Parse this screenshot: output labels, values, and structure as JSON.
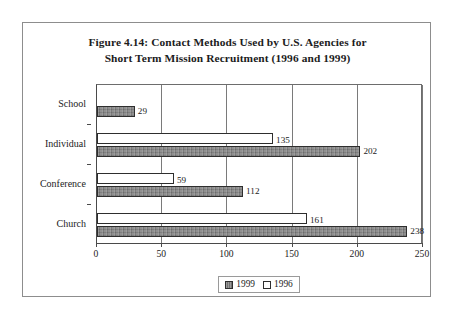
{
  "figure": {
    "title_line1": "Figure 4.14: Contact Methods Used by U.S. Agencies for",
    "title_line2": "Short Term Mission Recruitment (1996 and 1999)"
  },
  "legend": {
    "position": "bottom-center",
    "entries": [
      {
        "label": "1999",
        "swatch": "gray-filled"
      },
      {
        "label": "1996",
        "swatch": "white-empty"
      }
    ]
  },
  "axis": {
    "x_ticks": [
      "0",
      "50",
      "100",
      "150",
      "200",
      "250"
    ],
    "y_ticks": [
      "School",
      "Individual",
      "Conference",
      "Church"
    ]
  },
  "chart_data": {
    "type": "bar",
    "orientation": "horizontal",
    "title": "Figure 4.14: Contact Methods Used by U.S. Agencies for Short Term Mission Recruitment (1996 and 1999)",
    "categories": [
      "School",
      "Individual",
      "Conference",
      "Church"
    ],
    "series": [
      {
        "name": "1999",
        "values": [
          29,
          202,
          112,
          238
        ]
      },
      {
        "name": "1996",
        "values": [
          0,
          135,
          59,
          161
        ]
      }
    ],
    "data_labels": {
      "1999": [
        "29",
        "202",
        "112",
        "238"
      ],
      "1996": [
        "",
        "135",
        "59",
        "161"
      ]
    },
    "xlabel": "",
    "ylabel": "",
    "xlim": [
      0,
      250
    ],
    "xticks": [
      0,
      50,
      100,
      150,
      200,
      250
    ],
    "grid": "vertical",
    "legend_position": "bottom-center",
    "colors": {
      "1999": "#818181",
      "1996": "#ffffff",
      "outline": "#2e2e2e"
    }
  }
}
